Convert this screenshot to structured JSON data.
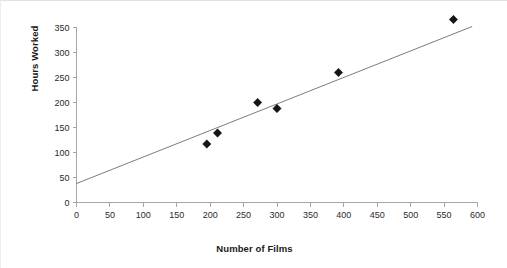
{
  "chart_data": {
    "type": "scatter",
    "title": "",
    "xlabel": "Number of Films",
    "ylabel": "Hours Worked",
    "xlim": [
      0,
      600
    ],
    "ylim": [
      0,
      350
    ],
    "x_ticks": [
      0,
      50,
      100,
      150,
      200,
      250,
      300,
      350,
      400,
      450,
      500,
      550,
      600
    ],
    "y_ticks": [
      0,
      50,
      100,
      150,
      200,
      250,
      300,
      350
    ],
    "grid": false,
    "legend": "none",
    "marker_style": "filled-diamond",
    "points": [
      {
        "x": 195,
        "y": 117
      },
      {
        "x": 211,
        "y": 139
      },
      {
        "x": 271,
        "y": 200
      },
      {
        "x": 300,
        "y": 188
      },
      {
        "x": 392,
        "y": 260
      },
      {
        "x": 564,
        "y": 366
      }
    ],
    "series": [
      {
        "name": "Hours Worked vs Number of Films",
        "x": [
          195,
          211,
          271,
          300,
          392,
          564
        ],
        "values": [
          117,
          139,
          200,
          188,
          260,
          366
        ]
      }
    ],
    "trendline": {
      "type": "linear-fit",
      "x_start": 0,
      "y_start": 38,
      "x_end": 592,
      "y_end": 352
    },
    "colors": {
      "marker": "#141414",
      "trendline": "#5a5a5a",
      "axis": "#a6a6a6",
      "text": "#1a1a1a",
      "background": "#ffffff"
    }
  }
}
